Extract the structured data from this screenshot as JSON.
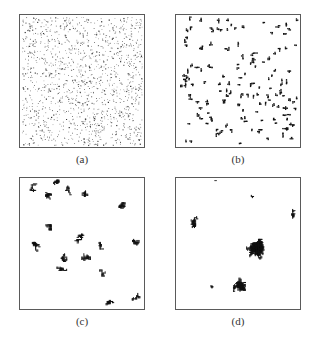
{
  "figure": {
    "panels": [
      {
        "id": "a",
        "label": "(a)",
        "kind": "random-sites",
        "density": 1400,
        "seed": 11
      },
      {
        "id": "b",
        "label": "(b)",
        "kind": "small-clusters",
        "count": 150,
        "seed": 23
      },
      {
        "id": "c",
        "label": "(c)",
        "kind": "medium-clusters",
        "count": 17,
        "seed": 37
      },
      {
        "id": "d",
        "label": "(d)",
        "kind": "large-cluster",
        "count": 7,
        "seed": 51
      }
    ],
    "colors": {
      "border": "#5a5a5a",
      "particle": "#111111",
      "background": "#ffffff"
    }
  }
}
